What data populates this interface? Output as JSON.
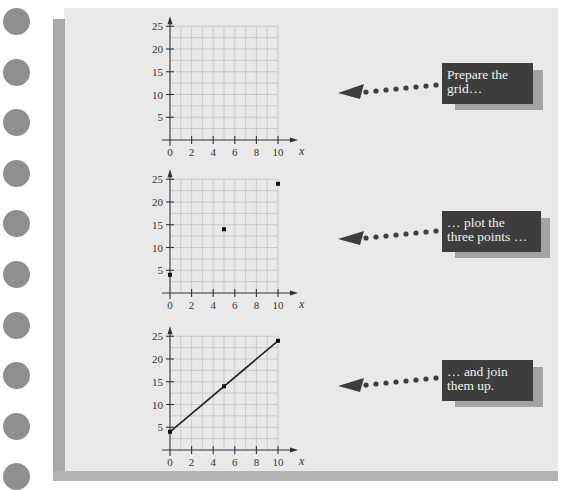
{
  "page": {
    "binder_hole_count": 10,
    "colors": {
      "panel": "#e9e9e9",
      "left_bar": "#a9a9a9",
      "hole": "#8f8f8f",
      "callout_box": "#3d3d3d",
      "callout_shadow": "#a3a3a3",
      "callout_text": "#f2f2f2",
      "arrow": "#3d3d3d",
      "grid": "#c4c4c4",
      "axis": "#333333"
    }
  },
  "steps": [
    {
      "callout_text_line1": "Prepare the",
      "callout_text_line2": "grid…"
    },
    {
      "callout_text_line1": "… plot the",
      "callout_text_line2": "three points …"
    },
    {
      "callout_text_line1": "… and join",
      "callout_text_line2": "them up."
    }
  ],
  "chart_data": [
    {
      "type": "scatter",
      "title": "Prepare the grid…",
      "xlabel": "x",
      "ylabel": "",
      "x_ticks": [
        "0",
        "2",
        "4",
        "6",
        "8",
        "10"
      ],
      "y_ticks": [
        "5",
        "10",
        "15",
        "20",
        "25"
      ],
      "xlim": [
        0,
        10
      ],
      "ylim": [
        0,
        25
      ],
      "grid": true,
      "points": []
    },
    {
      "type": "scatter",
      "title": "… plot the three points …",
      "xlabel": "x",
      "ylabel": "",
      "x_ticks": [
        "0",
        "2",
        "4",
        "6",
        "8",
        "10"
      ],
      "y_ticks": [
        "5",
        "10",
        "15",
        "20",
        "25"
      ],
      "xlim": [
        0,
        10
      ],
      "ylim": [
        0,
        25
      ],
      "grid": true,
      "points": [
        {
          "x": 0,
          "y": 4
        },
        {
          "x": 5,
          "y": 14
        },
        {
          "x": 10,
          "y": 24
        }
      ]
    },
    {
      "type": "line",
      "title": "… and join them up.",
      "xlabel": "x",
      "ylabel": "",
      "x_ticks": [
        "0",
        "2",
        "4",
        "6",
        "8",
        "10"
      ],
      "y_ticks": [
        "5",
        "10",
        "15",
        "20",
        "25"
      ],
      "xlim": [
        0,
        10
      ],
      "ylim": [
        0,
        25
      ],
      "grid": true,
      "points": [
        {
          "x": 0,
          "y": 4
        },
        {
          "x": 5,
          "y": 14
        },
        {
          "x": 10,
          "y": 24
        }
      ],
      "line": {
        "from": {
          "x": 0,
          "y": 4
        },
        "to": {
          "x": 10,
          "y": 24
        }
      }
    }
  ]
}
